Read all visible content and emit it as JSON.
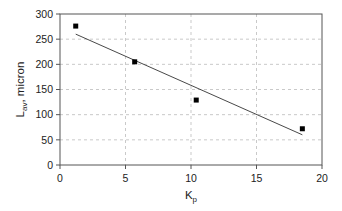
{
  "chart_data": {
    "type": "scatter",
    "title": "",
    "xlabel": "K_p",
    "xlabel_main": "K",
    "xlabel_sub": "p",
    "ylabel": "L_av, micron",
    "ylabel_main": "L",
    "ylabel_sub": "av",
    "ylabel_rest": ", micron",
    "xlim": [
      0,
      20
    ],
    "ylim": [
      0,
      300
    ],
    "xticks": [
      0,
      5,
      10,
      15,
      20
    ],
    "yticks": [
      0,
      50,
      100,
      150,
      200,
      250,
      300
    ],
    "grid": true,
    "legend": null,
    "series": [
      {
        "name": "measured",
        "type": "scatter",
        "marker": "square",
        "x": [
          1.2,
          5.7,
          10.4,
          18.5
        ],
        "y": [
          276,
          205,
          129,
          72
        ]
      },
      {
        "name": "linear fit",
        "type": "line",
        "x": [
          1.2,
          18.5
        ],
        "y": [
          260,
          60
        ]
      }
    ]
  }
}
